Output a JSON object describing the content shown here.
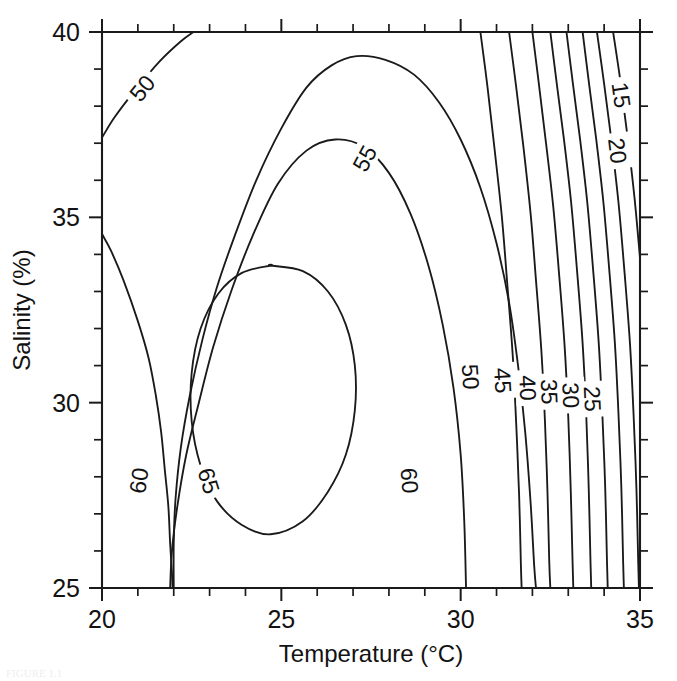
{
  "figure": {
    "caption_partial": "FIGURE 1.1",
    "background_color": "#ffffff",
    "line_color": "#1a1a1a"
  },
  "chart_data": {
    "type": "contour",
    "title": "",
    "subtitle": "",
    "xlabel": "Temperature (°C)",
    "ylabel": "Salinity (%)",
    "xlim": [
      20,
      35
    ],
    "ylim": [
      25,
      40
    ],
    "xticks": [
      20,
      25,
      30,
      35
    ],
    "xtick_labels": [
      "20",
      "25",
      "30",
      "35"
    ],
    "yticks": [
      25,
      30,
      35,
      40
    ],
    "ytick_labels": [
      "25",
      "30",
      "35",
      "40"
    ],
    "x_minor_tick_step": 1,
    "y_minor_tick_step": 1,
    "grid": false,
    "legend": "none",
    "contour_levels": [
      15,
      20,
      25,
      30,
      35,
      40,
      45,
      50,
      55,
      60,
      65
    ],
    "level_labels": [
      "15",
      "20",
      "25",
      "30",
      "35",
      "40",
      "45",
      "50",
      "55",
      "60",
      "65"
    ],
    "maximum": {
      "temperature": 24.7,
      "salinity": 32.0,
      "value_above": 65
    },
    "annotations": [
      {
        "label": "50",
        "x": 21.1,
        "y": 38.5
      },
      {
        "label": "55",
        "x": 27.3,
        "y": 36.6
      },
      {
        "label": "15",
        "x": 34.5,
        "y": 38.3
      },
      {
        "label": "20",
        "x": 34.4,
        "y": 36.8
      },
      {
        "label": "50",
        "x": 30.3,
        "y": 30.7
      },
      {
        "label": "45",
        "x": 31.2,
        "y": 30.6
      },
      {
        "label": "40",
        "x": 31.9,
        "y": 30.4
      },
      {
        "label": "35",
        "x": 32.5,
        "y": 30.3
      },
      {
        "label": "30",
        "x": 33.1,
        "y": 30.2
      },
      {
        "label": "25",
        "x": 33.7,
        "y": 30.1
      },
      {
        "label": "60",
        "x": 21.0,
        "y": 27.9
      },
      {
        "label": "65",
        "x": 23.0,
        "y": 27.9
      },
      {
        "label": "60",
        "x": 28.6,
        "y": 27.9
      }
    ],
    "contours": [
      {
        "level": 50,
        "closed": false,
        "points": [
          [
            20.0,
            37.15
          ],
          [
            20.35,
            37.7
          ],
          [
            20.9,
            38.4
          ],
          [
            21.6,
            39.2
          ],
          [
            22.2,
            39.75
          ],
          [
            22.55,
            40.0
          ]
        ]
      },
      {
        "level": 50,
        "closed": false,
        "comment": "lower-left branch of 50 contour leaving left edge",
        "points": [
          [
            20.0,
            34.55
          ],
          [
            20.25,
            34.1
          ],
          [
            20.6,
            33.3
          ],
          [
            21.0,
            32.2
          ],
          [
            21.3,
            31.2
          ],
          [
            21.5,
            30.2
          ],
          [
            21.65,
            29.2
          ],
          [
            21.75,
            28.2
          ],
          [
            21.85,
            27.2
          ],
          [
            21.9,
            26.2
          ],
          [
            21.95,
            25.4
          ],
          [
            21.97,
            25.0
          ]
        ]
      },
      {
        "level": 55,
        "closed": false,
        "comment": "big arch: left edge of 55 loop rises from bottom-left to crest then down right side",
        "points": [
          [
            22.0,
            25.0
          ],
          [
            22.0,
            26.2
          ],
          [
            22.05,
            27.4
          ],
          [
            22.2,
            28.8
          ],
          [
            22.45,
            30.2
          ],
          [
            22.8,
            31.7
          ],
          [
            23.2,
            33.1
          ],
          [
            23.7,
            34.5
          ],
          [
            24.3,
            36.0
          ],
          [
            25.0,
            37.4
          ],
          [
            25.7,
            38.5
          ],
          [
            26.4,
            39.1
          ],
          [
            27.1,
            39.35
          ],
          [
            27.9,
            39.25
          ],
          [
            28.7,
            38.85
          ],
          [
            29.4,
            38.1
          ],
          [
            30.0,
            37.1
          ],
          [
            30.55,
            35.8
          ],
          [
            31.0,
            34.3
          ],
          [
            31.35,
            32.7
          ],
          [
            31.6,
            31.0
          ],
          [
            31.8,
            29.2
          ],
          [
            31.95,
            27.3
          ],
          [
            32.05,
            25.6
          ],
          [
            32.1,
            25.0
          ]
        ]
      },
      {
        "level": 60,
        "closed": false,
        "comment": "inner loop open at bottom axis",
        "points": [
          [
            21.9,
            25.0
          ],
          [
            21.95,
            26.0
          ],
          [
            22.1,
            27.2
          ],
          [
            22.35,
            28.6
          ],
          [
            22.7,
            30.0
          ],
          [
            23.1,
            31.5
          ],
          [
            23.6,
            33.0
          ],
          [
            24.2,
            34.5
          ],
          [
            24.9,
            35.9
          ],
          [
            25.7,
            36.8
          ],
          [
            26.5,
            37.1
          ],
          [
            27.3,
            36.9
          ],
          [
            28.0,
            36.2
          ],
          [
            28.6,
            35.1
          ],
          [
            29.1,
            33.7
          ],
          [
            29.5,
            32.1
          ],
          [
            29.8,
            30.4
          ],
          [
            30.0,
            28.6
          ],
          [
            30.1,
            26.8
          ],
          [
            30.15,
            25.0
          ]
        ]
      },
      {
        "level": 65,
        "closed": true,
        "comment": "innermost closed ellipse around maximum",
        "points": [
          [
            24.7,
            33.7
          ],
          [
            25.6,
            33.55
          ],
          [
            26.3,
            33.0
          ],
          [
            26.8,
            32.1
          ],
          [
            27.05,
            31.0
          ],
          [
            27.05,
            29.8
          ],
          [
            26.8,
            28.6
          ],
          [
            26.3,
            27.6
          ],
          [
            25.6,
            26.8
          ],
          [
            24.7,
            26.45
          ],
          [
            23.9,
            26.7
          ],
          [
            23.2,
            27.35
          ],
          [
            22.75,
            28.3
          ],
          [
            22.5,
            29.5
          ],
          [
            22.5,
            30.8
          ],
          [
            22.75,
            32.0
          ],
          [
            23.25,
            32.95
          ],
          [
            23.9,
            33.5
          ],
          [
            24.7,
            33.7
          ]
        ]
      },
      {
        "level": 50,
        "closed": false,
        "comment": "right family line nearest the 55 arch",
        "points": [
          [
            30.55,
            40.0
          ],
          [
            30.75,
            38.5
          ],
          [
            30.95,
            36.8
          ],
          [
            31.15,
            35.0
          ],
          [
            31.3,
            33.2
          ],
          [
            31.45,
            31.3
          ],
          [
            31.55,
            29.4
          ],
          [
            31.63,
            27.5
          ],
          [
            31.68,
            25.6
          ],
          [
            31.7,
            25.0
          ]
        ]
      },
      {
        "level": 45,
        "closed": false,
        "points": [
          [
            31.35,
            40.0
          ],
          [
            31.55,
            38.5
          ],
          [
            31.75,
            36.9
          ],
          [
            31.95,
            35.1
          ],
          [
            32.1,
            33.3
          ],
          [
            32.25,
            31.4
          ],
          [
            32.35,
            29.5
          ],
          [
            32.42,
            27.6
          ],
          [
            32.47,
            25.7
          ],
          [
            32.5,
            25.0
          ]
        ]
      },
      {
        "level": 40,
        "closed": false,
        "points": [
          [
            32.0,
            40.0
          ],
          [
            32.18,
            38.6
          ],
          [
            32.38,
            37.0
          ],
          [
            32.58,
            35.3
          ],
          [
            32.75,
            33.4
          ],
          [
            32.9,
            31.5
          ],
          [
            33.0,
            29.6
          ],
          [
            33.07,
            27.6
          ],
          [
            33.12,
            25.7
          ],
          [
            33.14,
            25.0
          ]
        ]
      },
      {
        "level": 35,
        "closed": false,
        "points": [
          [
            32.5,
            40.0
          ],
          [
            32.68,
            38.6
          ],
          [
            32.88,
            37.1
          ],
          [
            33.08,
            35.4
          ],
          [
            33.25,
            33.5
          ],
          [
            33.4,
            31.6
          ],
          [
            33.5,
            29.7
          ],
          [
            33.57,
            27.7
          ],
          [
            33.62,
            25.7
          ],
          [
            33.64,
            25.0
          ]
        ]
      },
      {
        "level": 30,
        "closed": false,
        "points": [
          [
            32.95,
            40.0
          ],
          [
            33.13,
            38.6
          ],
          [
            33.33,
            37.1
          ],
          [
            33.53,
            35.4
          ],
          [
            33.7,
            33.5
          ],
          [
            33.85,
            31.6
          ],
          [
            33.95,
            29.7
          ],
          [
            34.03,
            27.7
          ],
          [
            34.08,
            25.7
          ],
          [
            34.1,
            25.0
          ]
        ]
      },
      {
        "level": 25,
        "closed": false,
        "points": [
          [
            33.4,
            40.0
          ],
          [
            33.58,
            38.6
          ],
          [
            33.78,
            37.1
          ],
          [
            33.98,
            35.4
          ],
          [
            34.15,
            33.5
          ],
          [
            34.3,
            31.6
          ],
          [
            34.4,
            29.7
          ],
          [
            34.48,
            27.7
          ],
          [
            34.53,
            25.7
          ],
          [
            34.55,
            25.0
          ]
        ]
      },
      {
        "level": 20,
        "closed": false,
        "points": [
          [
            33.8,
            40.0
          ],
          [
            34.0,
            38.6
          ],
          [
            34.2,
            37.1
          ],
          [
            34.4,
            35.4
          ],
          [
            34.57,
            33.5
          ],
          [
            34.72,
            31.6
          ],
          [
            34.82,
            29.7
          ],
          [
            34.9,
            27.7
          ],
          [
            34.95,
            25.7
          ],
          [
            34.97,
            25.0
          ]
        ]
      },
      {
        "level": 15,
        "closed": false,
        "points": [
          [
            34.25,
            40.0
          ],
          [
            34.45,
            38.7
          ],
          [
            34.65,
            37.2
          ],
          [
            34.85,
            35.5
          ],
          [
            35.0,
            33.9
          ]
        ]
      }
    ]
  }
}
